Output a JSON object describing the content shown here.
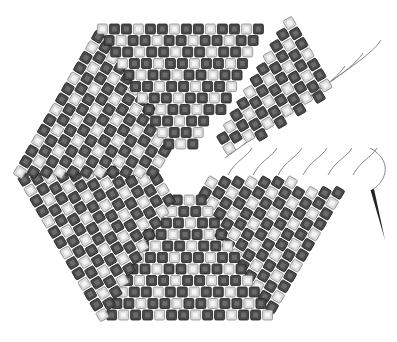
{
  "figure": {
    "title": "",
    "colors": {
      "background": "#ffffff",
      "bead_dark": "#4a4a4a",
      "bead_light": "#d9d9d9",
      "thread": "#7a7a7a",
      "needle": "#222222"
    },
    "shape": "hexagon",
    "center": [
      185,
      172
    ],
    "radius": 178,
    "bead_size": 10,
    "gap_wedge": {
      "start_angle_deg": -30,
      "end_angle_deg": 5
    },
    "needle": {
      "tip": [
        385,
        240
      ],
      "eye": [
        372,
        190
      ]
    },
    "labels": []
  }
}
